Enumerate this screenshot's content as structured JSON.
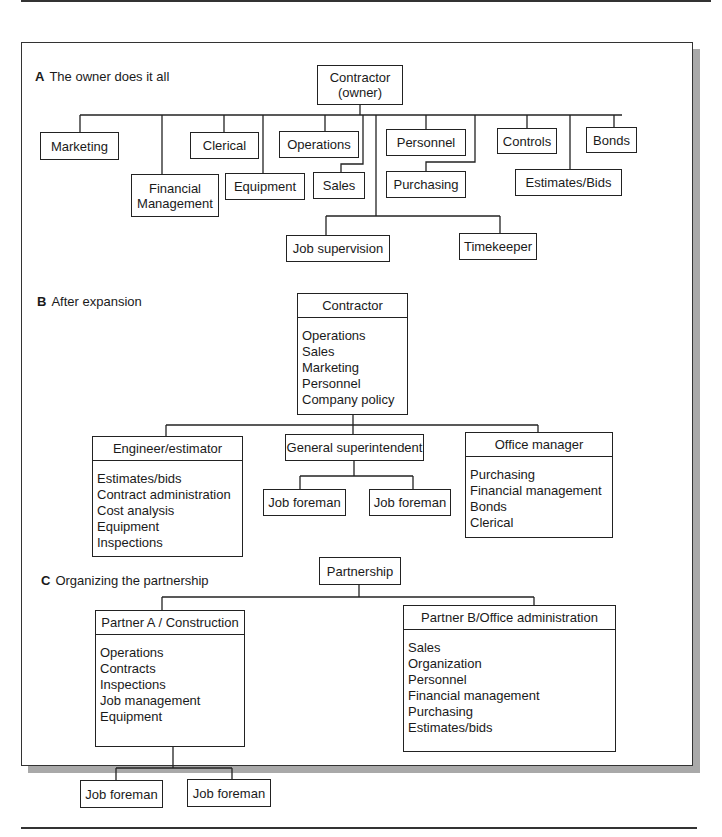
{
  "section_a": {
    "letter": "A",
    "title": "The owner does it all",
    "root": {
      "line1": "Contractor",
      "line2": "(owner)"
    },
    "nodes": {
      "marketing": "Marketing",
      "financial_1": "Financial",
      "financial_2": "Management",
      "clerical": "Clerical",
      "equipment": "Equipment",
      "operations": "Operations",
      "sales": "Sales",
      "personnel": "Personnel",
      "purchasing": "Purchasing",
      "controls": "Controls",
      "estimates": "Estimates/Bids",
      "bonds": "Bonds",
      "job_supervision": "Job supervision",
      "timekeeper": "Timekeeper"
    }
  },
  "section_b": {
    "letter": "B",
    "title": "After expansion",
    "root": {
      "title": "Contractor",
      "items": [
        "Operations",
        "Sales",
        "Marketing",
        "Personnel",
        "Company policy"
      ]
    },
    "engineer": {
      "title": "Engineer/estimator",
      "items": [
        "Estimates/bids",
        "Contract administration",
        "Cost analysis",
        "Equipment",
        "Inspections"
      ]
    },
    "superintendent": {
      "title": "General superintendent",
      "foremen": [
        "Job foreman",
        "Job foreman"
      ]
    },
    "office": {
      "title": "Office manager",
      "items": [
        "Purchasing",
        "Financial management",
        "Bonds",
        "Clerical"
      ]
    }
  },
  "section_c": {
    "letter": "C",
    "title": "Organizing the partnership",
    "root": "Partnership",
    "partner_a": {
      "title": "Partner A / Construction",
      "items": [
        "Operations",
        "Contracts",
        "Inspections",
        "Job management",
        "Equipment"
      ],
      "foremen": [
        "Job foreman",
        "Job foreman"
      ]
    },
    "partner_b": {
      "title": "Partner B/Office administration",
      "items": [
        "Sales",
        "Organization",
        "Personnel",
        "Financial management",
        "Purchasing",
        "Estimates/bids"
      ]
    }
  }
}
